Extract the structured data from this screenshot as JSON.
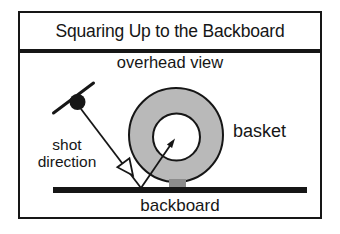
{
  "figure": {
    "title": "Squaring Up to the Backboard",
    "subtitle": "overhead view",
    "labels": {
      "shot_direction": "shot direction",
      "basket": "basket",
      "backboard": "backboard"
    }
  },
  "colors": {
    "ink": "#161616",
    "ring_fill": "#b9b9b9",
    "ring_hole_fill": "#ffffff",
    "mount_fill": "#8c8c8c",
    "arrowhead_open_fill": "#ffffff",
    "background": "#ffffff"
  }
}
